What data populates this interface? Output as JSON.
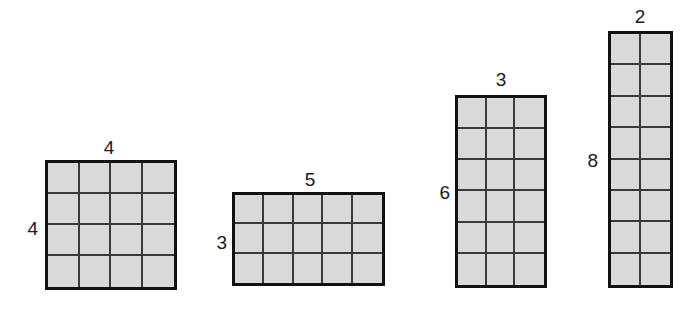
{
  "diagram": {
    "background_color": "#ffffff",
    "cell_fill_color": "#d9d9d9",
    "outer_border_color": "#111111",
    "inner_line_color": "#3a3a3a",
    "label_color": "#1a1a1a",
    "rectangles": [
      {
        "name": "rectangle-1",
        "columns": 4,
        "rows": 4,
        "top_label": "4",
        "left_label": "4",
        "x": 45,
        "y": 160,
        "width": 132,
        "height": 130,
        "top_label_x": 109,
        "top_label_y": 138,
        "left_label_x": 38,
        "left_label_y": 228
      },
      {
        "name": "rectangle-2",
        "columns": 5,
        "rows": 3,
        "top_label": "5",
        "left_label": "3",
        "x": 232,
        "y": 192,
        "width": 153,
        "height": 94,
        "top_label_x": 310,
        "top_label_y": 170,
        "left_label_x": 227,
        "left_label_y": 242
      },
      {
        "name": "rectangle-3",
        "columns": 3,
        "rows": 6,
        "top_label": "3",
        "left_label": "6",
        "x": 455,
        "y": 95,
        "width": 92,
        "height": 193,
        "top_label_x": 501,
        "top_label_y": 70,
        "left_label_x": 450,
        "left_label_y": 192
      },
      {
        "name": "rectangle-4",
        "columns": 2,
        "rows": 8,
        "top_label": "2",
        "left_label": "8",
        "x": 608,
        "y": 31,
        "width": 65,
        "height": 257,
        "top_label_x": 640,
        "top_label_y": 7,
        "left_label_x": 598,
        "left_label_y": 160
      }
    ]
  }
}
